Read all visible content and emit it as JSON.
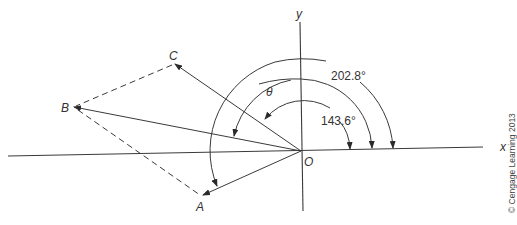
{
  "diagram": {
    "type": "vector-addition-polar-angles",
    "axes": {
      "x_label": "x",
      "y_label": "y",
      "origin_label": "O"
    },
    "points": {
      "A": {
        "label": "A"
      },
      "B": {
        "label": "B"
      },
      "C": {
        "label": "C"
      }
    },
    "vectors": [
      {
        "name": "OA",
        "from": "O",
        "to": "A",
        "style": "solid-arrow"
      },
      {
        "name": "OB",
        "from": "O",
        "to": "B",
        "style": "solid-arrow"
      },
      {
        "name": "OC",
        "from": "O",
        "to": "C",
        "style": "solid-arrow"
      }
    ],
    "dashed_lines": [
      {
        "from": "C",
        "to": "B"
      },
      {
        "from": "B",
        "to": "A"
      }
    ],
    "angle_arcs": [
      {
        "name": "angle-C",
        "label": "143.6°",
        "from_axis": "x",
        "to_vector": "OC"
      },
      {
        "name": "angle-theta",
        "label": "θ",
        "from_axis": "x",
        "to_vector": "OB"
      },
      {
        "name": "angle-A",
        "label": "202.8°",
        "from_axis": "x",
        "to_vector": "OA"
      }
    ],
    "copyright": "© Cengage Learning 2013",
    "colors": {
      "line": "#3a3a3a",
      "text": "#333333",
      "background": "#ffffff"
    }
  }
}
